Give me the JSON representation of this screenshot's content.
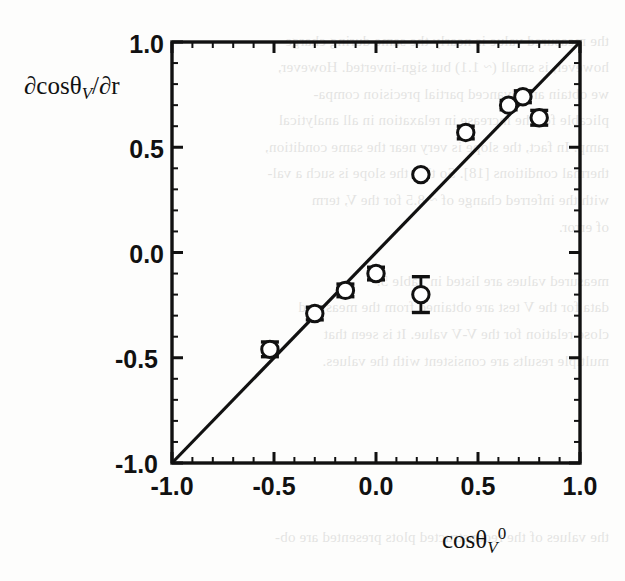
{
  "document": {
    "type": "scanned-journal-figure",
    "background_color": "#fdfdfc",
    "ink_color": "#111111"
  },
  "bleed_text": {
    "note": "faint mirrored show-through text from the reverse page",
    "lines": [
      "the measured value is nearly the same during charge",
      "however, is small (~ 1.1) but sign-inverted. However,",
      "we obtain an advanced partial precision compa-",
      "plicable for the increase in relaxation in all analytical",
      "ramp. In fact, the slope is very near the same condition,",
      "thermal conditions [18]. So that the slope is such a val-",
      "with the inferred change of ~ 8.5 for the V, term",
      "of error.",
      "measured values are listed in Table 5.",
      "data for the V test are obtained from the measured",
      "close relation for the V-V value. It is seen that",
      "multiple results are consistent with the values."
    ],
    "footer_line": "the values of the reconstructed plots presented are ob-"
  },
  "chart_data": {
    "type": "scatter",
    "title": "",
    "xlabel": "cosθ_V^0",
    "ylabel": "∂cosθ_V/∂r",
    "xlim": [
      -1.0,
      1.0
    ],
    "ylim": [
      -1.0,
      1.0
    ],
    "xticks": [
      -1.0,
      -0.5,
      0.0,
      0.5,
      1.0
    ],
    "yticks": [
      -1.0,
      -0.5,
      0.0,
      0.5,
      1.0
    ],
    "xtick_labels": [
      "-1.0",
      "-0.5",
      "0.0",
      "0.5",
      "1.0"
    ],
    "ytick_labels": [
      "-1.0",
      "-0.5",
      "0.0",
      "0.5",
      "1.0"
    ],
    "minor_ticks_between_major": 4,
    "grid": false,
    "legend": null,
    "marker": "open-circle",
    "reference_line": {
      "label": "y = x identity line",
      "from": [
        -1.0,
        -1.0
      ],
      "to": [
        1.0,
        1.0
      ],
      "style": "solid",
      "color": "#111111"
    },
    "points": [
      {
        "x": -0.52,
        "y": -0.46,
        "yerr": 0.035
      },
      {
        "x": -0.3,
        "y": -0.29,
        "yerr": 0.03
      },
      {
        "x": -0.15,
        "y": -0.18,
        "yerr": 0.03
      },
      {
        "x": 0.0,
        "y": -0.1,
        "yerr": 0.03
      },
      {
        "x": 0.22,
        "y": -0.2,
        "yerr": 0.085
      },
      {
        "x": 0.22,
        "y": 0.37,
        "yerr": 0.012
      },
      {
        "x": 0.44,
        "y": 0.57,
        "yerr": 0.03
      },
      {
        "x": 0.65,
        "y": 0.7,
        "yerr": 0.022
      },
      {
        "x": 0.72,
        "y": 0.74,
        "yerr": 0.028
      },
      {
        "x": 0.8,
        "y": 0.64,
        "yerr": 0.035
      }
    ]
  }
}
